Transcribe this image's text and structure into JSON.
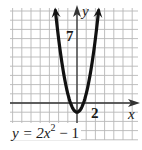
{
  "chart_data": {
    "type": "line",
    "title": "",
    "equation": "y = 2x^2 - 1",
    "equation_display": {
      "prefix": "y = 2x",
      "exponent": "2",
      "suffix": " − 1"
    },
    "xlabel": "x",
    "ylabel": "y",
    "tick_labels": {
      "x": [
        "2"
      ],
      "y": [
        "7"
      ]
    },
    "labeled_ticks": {
      "x": [
        2
      ],
      "y": [
        7
      ]
    },
    "xlim": [
      -7,
      6.7
    ],
    "ylim": [
      -3.9,
      10.5
    ],
    "grid": true,
    "grid_step": 1,
    "vertex": [
      0,
      -1
    ],
    "series": [
      {
        "name": "y = 2x^2 - 1",
        "x": [
          -2.35,
          -2,
          -1.5,
          -1,
          -0.5,
          0,
          0.5,
          1,
          1.5,
          2,
          2.35
        ],
        "y": [
          10.05,
          7,
          3.5,
          1,
          -0.5,
          -1,
          -0.5,
          1,
          3.5,
          7,
          10.05
        ]
      }
    ],
    "colors": {
      "grid": "#b8b8b8",
      "axis": "#333333",
      "curve": "#111111",
      "background": "#ffffff"
    }
  },
  "labels": {
    "x_axis": "x",
    "y_axis": "y",
    "y_tick": "7",
    "x_tick": "2"
  }
}
